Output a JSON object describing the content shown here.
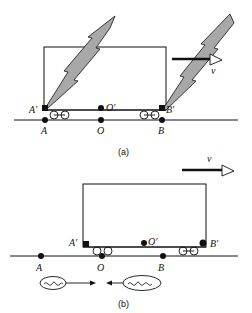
{
  "figure_a": {
    "caption": "(a)",
    "labels": {
      "A_prime": "A′",
      "O_prime": "O′",
      "B_prime": "B′",
      "A": "A",
      "O": "O",
      "B": "B",
      "velocity": "v"
    }
  },
  "figure_b": {
    "caption": "(b)",
    "labels": {
      "A_prime": "A′",
      "O_prime": "O′",
      "B_prime": "B′",
      "A": "A",
      "O": "O",
      "B": "B",
      "velocity": "v"
    }
  },
  "colors": {
    "stroke": "#111111",
    "lightning_fill": "#a8a8a8",
    "background": "#ffffff"
  }
}
